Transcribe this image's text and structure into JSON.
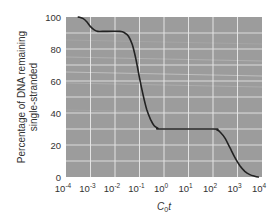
{
  "chart_data": {
    "type": "line",
    "title": "",
    "xlabel": "C0t",
    "xlabel_main": "C",
    "xlabel_sub": "0",
    "xlabel_tail": "t",
    "ylabel_line1": "Percentage of DNA remaining",
    "ylabel_line2": "single-stranded",
    "xscale": "log",
    "xlim": [
      -4,
      4
    ],
    "ylim": [
      0,
      100
    ],
    "grid": true,
    "x_ticks": [
      {
        "base": "10",
        "exp": "-4",
        "log": -4
      },
      {
        "base": "10",
        "exp": "-3",
        "log": -3
      },
      {
        "base": "10",
        "exp": "-2",
        "log": -2
      },
      {
        "base": "10",
        "exp": "-1",
        "log": -1
      },
      {
        "base": "10",
        "exp": "0",
        "log": 0
      },
      {
        "base": "10",
        "exp": "1",
        "log": 1
      },
      {
        "base": "10",
        "exp": "2",
        "log": 2
      },
      {
        "base": "10",
        "exp": "3",
        "log": 3
      },
      {
        "base": "10",
        "exp": "4",
        "log": 4
      }
    ],
    "y_ticks": [
      0,
      20,
      40,
      60,
      80,
      100
    ],
    "y_minor_gridlines": [
      10,
      30,
      50,
      70,
      90
    ],
    "series": [
      {
        "name": "reassociation curve",
        "x_log10": [
          -3.5,
          -3.3,
          -3.15,
          -3.0,
          -2.85,
          -2.7,
          -2.5,
          -1.8,
          -1.6,
          -1.45,
          -1.3,
          -1.15,
          -1.0,
          -0.85,
          -0.7,
          -0.55,
          -0.4,
          -0.25,
          -0.1,
          2.0,
          2.15,
          2.3,
          2.5,
          2.7,
          2.9,
          3.1,
          3.3,
          3.5,
          3.7,
          3.85
        ],
        "values": [
          100,
          99,
          97,
          94,
          92,
          91,
          91,
          91,
          90,
          88,
          83,
          74,
          62,
          51,
          42,
          36,
          32,
          30.5,
          30,
          30,
          29.5,
          28,
          24,
          18,
          12,
          7,
          3.5,
          1.5,
          0.5,
          0
        ]
      }
    ],
    "colors": {
      "plot_background": "#9c9c9c",
      "gridlines": "#e4e4e4",
      "curve": "#222222"
    }
  }
}
